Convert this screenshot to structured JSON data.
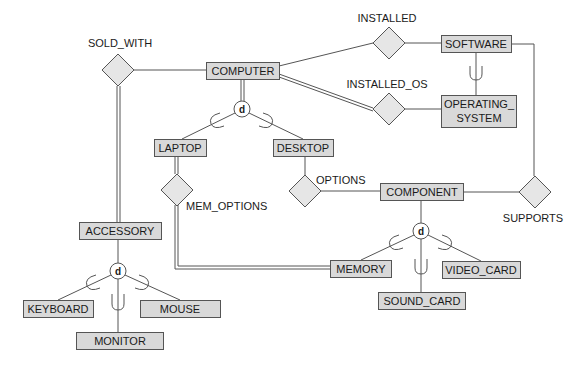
{
  "diagram": {
    "type": "EER diagram",
    "colors": {
      "entity_fill": "#d9d9d9",
      "relationship_fill": "#e6e6e6",
      "stroke": "#555555",
      "text": "#1a1a1a"
    },
    "entities": {
      "computer": "COMPUTER",
      "software": "SOFTWARE",
      "operating_system_line1": "OPERATING_",
      "operating_system_line2": "SYSTEM",
      "laptop": "LAPTOP",
      "desktop": "DESKTOP",
      "component": "COMPONENT",
      "accessory": "ACCESSORY",
      "keyboard": "KEYBOARD",
      "mouse": "MOUSE",
      "monitor": "MONITOR",
      "memory": "MEMORY",
      "video_card": "VIDEO_CARD",
      "sound_card": "SOUND_CARD"
    },
    "relationships": {
      "sold_with": "SOLD_WITH",
      "installed": "INSTALLED",
      "installed_os": "INSTALLED_OS",
      "mem_options": "MEM_OPTIONS",
      "options": "OPTIONS",
      "supports": "SUPPORTS"
    },
    "specializations": {
      "computer_disjoint": "d",
      "accessory_disjoint": "d",
      "component_disjoint": "d"
    }
  }
}
